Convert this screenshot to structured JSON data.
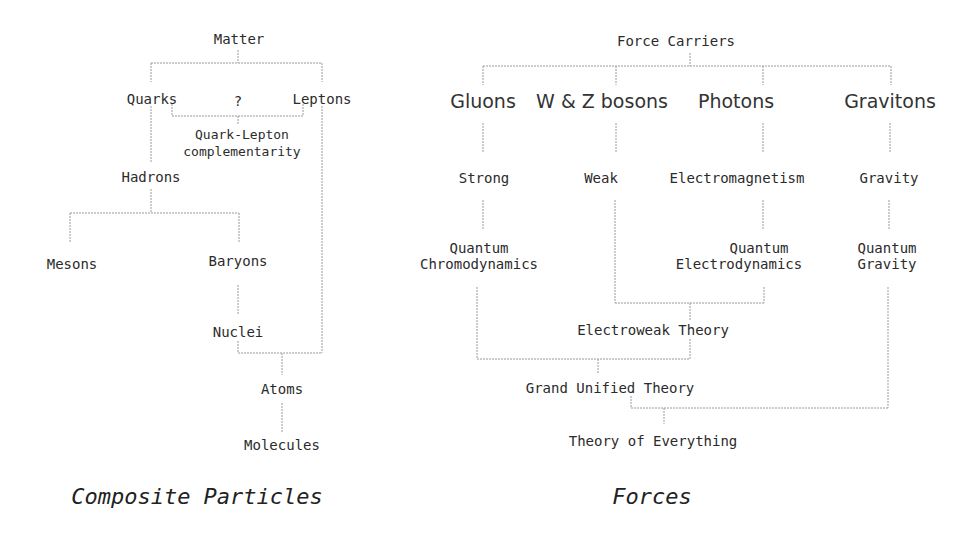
{
  "composite": {
    "caption": "Composite Particles",
    "nodes": {
      "matter": "Matter",
      "quarks": "Quarks",
      "question": "?",
      "leptons": "Leptons",
      "qlc_line1": "Quark-Lepton",
      "qlc_line2": "complementarity",
      "hadrons": "Hadrons",
      "mesons": "Mesons",
      "baryons": "Baryons",
      "nuclei": "Nuclei",
      "atoms": "Atoms",
      "molecules": "Molecules"
    },
    "edges": [
      [
        "Matter",
        "Quarks"
      ],
      [
        "Matter",
        "Leptons"
      ],
      [
        "Quarks",
        "Quark-Lepton complementarity"
      ],
      [
        "Leptons",
        "Quark-Lepton complementarity"
      ],
      [
        "Quarks",
        "Hadrons"
      ],
      [
        "Hadrons",
        "Mesons"
      ],
      [
        "Hadrons",
        "Baryons"
      ],
      [
        "Baryons",
        "Nuclei"
      ],
      [
        "Nuclei",
        "Atoms"
      ],
      [
        "Leptons",
        "Atoms"
      ],
      [
        "Atoms",
        "Molecules"
      ]
    ]
  },
  "forces": {
    "caption": "Forces",
    "nodes": {
      "force_carriers": "Force Carriers",
      "gluons": "Gluons",
      "wz": "W & Z bosons",
      "photons": "Photons",
      "gravitons": "Gravitons",
      "strong": "Strong",
      "weak": "Weak",
      "em": "Electromagnetism",
      "gravity": "Gravity",
      "qcd_line1": "Quantum",
      "qcd_line2": "Chromodynamics",
      "qed_line1": "Quantum",
      "qed_line2": "Electrodynamics",
      "qg_line1": "Quantum",
      "qg_line2": "Gravity",
      "electroweak": "Electroweak Theory",
      "gut": "Grand Unified Theory",
      "toe": "Theory of Everything"
    },
    "edges": [
      [
        "Force Carriers",
        "Gluons"
      ],
      [
        "Force Carriers",
        "W & Z bosons"
      ],
      [
        "Force Carriers",
        "Photons"
      ],
      [
        "Force Carriers",
        "Gravitons"
      ],
      [
        "Gluons",
        "Strong"
      ],
      [
        "W & Z bosons",
        "Weak"
      ],
      [
        "Photons",
        "Electromagnetism"
      ],
      [
        "Gravitons",
        "Gravity"
      ],
      [
        "Strong",
        "Quantum Chromodynamics"
      ],
      [
        "Electromagnetism",
        "Quantum Electrodynamics"
      ],
      [
        "Gravity",
        "Quantum Gravity"
      ],
      [
        "Weak",
        "Electroweak Theory"
      ],
      [
        "Quantum Electrodynamics",
        "Electroweak Theory"
      ],
      [
        "Quantum Chromodynamics",
        "Grand Unified Theory"
      ],
      [
        "Electroweak Theory",
        "Grand Unified Theory"
      ],
      [
        "Grand Unified Theory",
        "Theory of Everything"
      ],
      [
        "Quantum Gravity",
        "Theory of Everything"
      ]
    ]
  }
}
